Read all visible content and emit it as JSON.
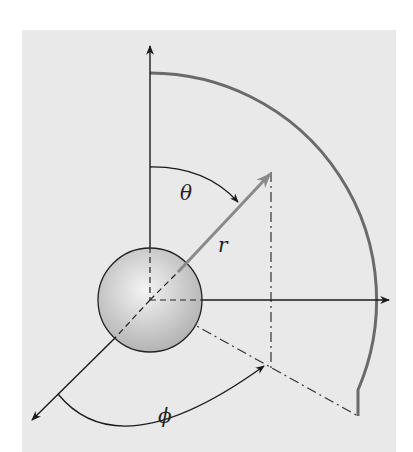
{
  "diagram": {
    "labels": {
      "theta": "θ",
      "r": "r",
      "phi": "ϕ"
    },
    "colors": {
      "background": "#e9e9e9",
      "axis": "#1a1a1a",
      "radius_vector": "#8a8a8a",
      "arc": "#6a6a6a",
      "sphere_fill": "#c8c8c8"
    }
  }
}
